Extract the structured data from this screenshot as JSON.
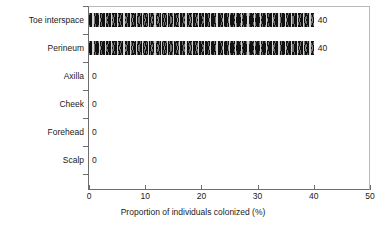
{
  "chart_data": {
    "type": "bar",
    "orientation": "horizontal",
    "title": "",
    "xlabel": "Proportion of individuals colonized (%)",
    "ylabel": "",
    "xlim": [
      0,
      50
    ],
    "xticks": [
      0,
      10,
      20,
      30,
      40,
      50
    ],
    "grid": false,
    "legend": null,
    "categories": [
      "Toe interspace",
      "Perineum",
      "Axilla",
      "Cheek",
      "Forehead",
      "Scalp"
    ],
    "values": [
      40,
      40,
      0,
      0,
      0,
      0
    ],
    "data_labels": [
      "40",
      "40",
      "0",
      "0",
      "0",
      "0"
    ],
    "bar_color": "#111111",
    "bar_pattern": "black fill with light vertical hatch motif",
    "axis_color": "#6e6e6e",
    "frame_color": "#b9b9b9"
  }
}
